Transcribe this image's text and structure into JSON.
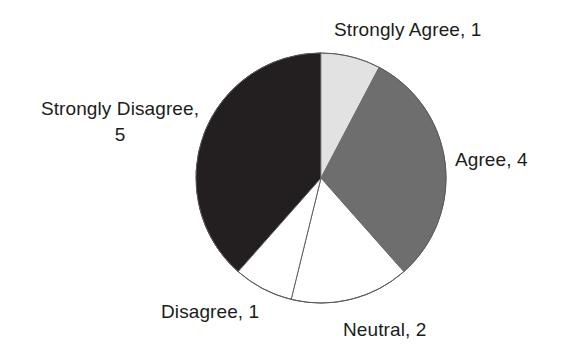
{
  "chart_data": {
    "type": "pie",
    "title": "",
    "categories": [
      "Strongly Agree",
      "Agree",
      "Neutral",
      "Disagree",
      "Strongly Disagree"
    ],
    "values": [
      1,
      4,
      2,
      1,
      5
    ],
    "total": 13,
    "start_angle_deg": 0,
    "direction": "clockwise",
    "legend": "none",
    "labels_position": "outside",
    "slices": [
      {
        "name": "Strongly Agree",
        "value": 1,
        "label": "Strongly Agree, 1",
        "color": "#e2e2e2",
        "start_deg": 0,
        "end_deg": 27.7
      },
      {
        "name": "Agree",
        "value": 4,
        "label": "Agree, 4",
        "color": "#6e6e6e",
        "start_deg": 27.7,
        "end_deg": 138.5
      },
      {
        "name": "Neutral",
        "value": 2,
        "label": "Neutral, 2",
        "color": "#ffffff",
        "start_deg": 138.5,
        "end_deg": 193.8
      },
      {
        "name": "Disagree",
        "value": 1,
        "label": "Disagree, 1",
        "color": "#ffffff",
        "start_deg": 193.8,
        "end_deg": 221.5
      },
      {
        "name": "Strongly Disagree",
        "value": 5,
        "label": "Strongly Disagree,\n5",
        "color": "#231f20",
        "start_deg": 221.5,
        "end_deg": 360
      }
    ]
  },
  "labels": {
    "strongly_agree": "Strongly Agree, 1",
    "agree": "Agree, 4",
    "strongly_disagree_line1": "Strongly Disagree,",
    "strongly_disagree_line2": "5",
    "disagree": "Disagree, 1",
    "neutral": "Neutral, 2"
  },
  "colors": {
    "strongly_agree": "#e2e2e2",
    "agree": "#6e6e6e",
    "neutral": "#ffffff",
    "disagree": "#ffffff",
    "strongly_disagree": "#231f20",
    "outline": "#555555",
    "background": "#ffffff",
    "text": "#1c1c1c"
  }
}
